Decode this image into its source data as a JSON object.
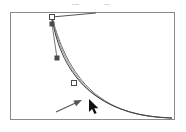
{
  "app": {
    "name": "vector-path-editor",
    "view_label": "artboard"
  },
  "canvas": {
    "width": 186,
    "height": 132,
    "background_color": "#ffffff"
  },
  "artboard": {
    "left": 10,
    "top": 12,
    "width": 165,
    "height": 108,
    "border_color": "#8a8a8a",
    "fill_color": "#ffffff"
  },
  "paths": [
    {
      "name": "original-curve",
      "stroke_color": "#6f6f6f",
      "stroke_width": 1,
      "d": "M 52 17 C 60 48 74 78 98 96 C 118 111 140 117 172 118"
    },
    {
      "name": "edited-curve",
      "stroke_color": "#3a3a3a",
      "stroke_width": 1,
      "d": "M 52 17 C 56 45 68 74 92 93 C 114 110 140 117 172 118"
    },
    {
      "name": "tangent-preview-curve",
      "stroke_color": "#9a9a9a",
      "stroke_width": 1,
      "d": "M 52 17 C 58 46 71 76 95 95 C 116 110 140 117 172 118"
    }
  ],
  "handle_lines": [
    {
      "name": "top-anchor-handle-line",
      "stroke_color": "#555555",
      "x1": 52,
      "y1": 17,
      "x2": 52,
      "y2": 24
    },
    {
      "name": "top-tangent-line",
      "stroke_color": "#555555",
      "x1": 52,
      "y1": 17,
      "x2": 96,
      "y2": 13
    },
    {
      "name": "direction-handle-line",
      "stroke_color": "#777777",
      "x1": 52,
      "y1": 24,
      "x2": 57,
      "y2": 58
    }
  ],
  "anchor_points": [
    {
      "name": "anchor-point-top",
      "type": "hollow-square",
      "x": 52,
      "y": 17,
      "size": 5,
      "fill": "#ffffff",
      "stroke": "#4a4a4a"
    },
    {
      "name": "direction-point-top",
      "type": "filled-square",
      "x": 52,
      "y": 24,
      "size": 4,
      "fill": "#4a4a4a",
      "stroke": "#4a4a4a"
    },
    {
      "name": "direction-point-mid",
      "type": "filled-square",
      "x": 57,
      "y": 58,
      "size": 4,
      "fill": "#4a4a4a",
      "stroke": "#4a4a4a"
    },
    {
      "name": "anchor-point-mid",
      "type": "hollow-square",
      "x": 74,
      "y": 83,
      "size": 5,
      "fill": "#ffffff",
      "stroke": "#4a4a4a"
    }
  ],
  "cursor": {
    "name": "arrow-cursor",
    "x": 89,
    "y": 99,
    "fill_color": "#111111",
    "outline_color": "#ffffff"
  },
  "callout_arrow": {
    "name": "callout-arrow",
    "stroke_color": "#555555",
    "fill_color": "#555555",
    "tail_x": 56,
    "tail_y": 112,
    "tip_x": 82,
    "tip_y": 100
  },
  "scan_artifacts": [
    {
      "name": "noise-mark-left",
      "x": 72,
      "y": 4,
      "width": 7
    },
    {
      "name": "noise-mark-right",
      "x": 104,
      "y": 4,
      "width": 6
    }
  ]
}
